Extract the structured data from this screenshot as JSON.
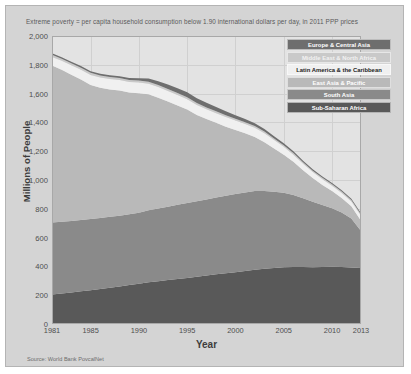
{
  "title": "Extreme poverty = per capita household consumption below 1.90 international dollars per day, in 2011 PPP prices",
  "source": "Source: World Bank PovcalNet",
  "axes": {
    "xlabel": "Year",
    "ylabel": "Millions of People"
  },
  "colors": {
    "figure_background": "#d4d4d4",
    "plot_background": "#e3e3e3",
    "grid": "#d0d0d0",
    "frame": "#a8a8a8",
    "text": "#4e4e4e"
  },
  "chart_data": {
    "type": "area",
    "title": "Extreme poverty = per capita household consumption below 1.90 international dollars per day, in 2011 PPP prices",
    "xlabel": "Year",
    "ylabel": "Millions of People",
    "grid": true,
    "legend_position": "top-right",
    "stacked": true,
    "xlim": [
      1981,
      2013
    ],
    "ylim": [
      0,
      2000
    ],
    "yticks": [
      "0",
      "200",
      "400",
      "600",
      "800",
      "1,000",
      "1,200",
      "1,400",
      "1,600",
      "1,800",
      "2,000"
    ],
    "ytick_values": [
      0,
      200,
      400,
      600,
      800,
      1000,
      1200,
      1400,
      1600,
      1800,
      2000
    ],
    "xticks": [
      "1981",
      "1985",
      "1990",
      "1995",
      "2000",
      "2005",
      "2010",
      "2013"
    ],
    "xtick_values": [
      1981,
      1985,
      1990,
      1995,
      2000,
      2005,
      2010,
      2013
    ],
    "x": [
      1981,
      1982,
      1983,
      1984,
      1985,
      1986,
      1987,
      1988,
      1989,
      1990,
      1991,
      1992,
      1993,
      1994,
      1995,
      1996,
      1997,
      1998,
      1999,
      2000,
      2001,
      2002,
      2003,
      2004,
      2005,
      2006,
      2007,
      2008,
      2009,
      2010,
      2011,
      2012,
      2013
    ],
    "series": [
      {
        "name": "Sub-Saharan Africa",
        "color": "#595959",
        "legend_text_color": "#ffffff",
        "values": [
          205,
          212,
          219,
          227,
          235,
          243,
          252,
          261,
          271,
          280,
          290,
          297,
          305,
          313,
          320,
          328,
          336,
          345,
          352,
          360,
          368,
          376,
          383,
          389,
          394,
          396,
          395,
          394,
          396,
          398,
          395,
          392,
          389
        ]
      },
      {
        "name": "South Asia",
        "color": "#8a8a8a",
        "legend_text_color": "#ffffff",
        "values": [
          500,
          498,
          497,
          496,
          495,
          493,
          492,
          491,
          492,
          493,
          500,
          505,
          510,
          515,
          520,
          524,
          528,
          533,
          538,
          542,
          546,
          548,
          540,
          530,
          517,
          500,
          478,
          455,
          430,
          405,
          380,
          340,
          256
        ]
      },
      {
        "name": "East Asia & Pacific",
        "color": "#b9b9b9",
        "legend_text_color": "#ffffff",
        "values": [
          1090,
          1055,
          1015,
          975,
          930,
          905,
          885,
          870,
          845,
          830,
          805,
          770,
          730,
          690,
          650,
          600,
          560,
          520,
          480,
          445,
          410,
          375,
          340,
          300,
          265,
          230,
          195,
          165,
          140,
          120,
          100,
          85,
          72
        ]
      },
      {
        "name": "Latin America & the Caribbean",
        "color": "#f0f0f0",
        "legend_text_color": "#1c1c1c",
        "values": [
          60,
          63,
          66,
          68,
          70,
          71,
          72,
          73,
          73,
          74,
          74,
          74,
          73,
          72,
          70,
          69,
          67,
          66,
          67,
          66,
          65,
          64,
          62,
          59,
          55,
          50,
          45,
          41,
          39,
          37,
          35,
          34,
          34
        ]
      },
      {
        "name": "Middle East & North Africa",
        "color": "#c9c9c9",
        "legend_text_color": "#f2f2f2",
        "values": [
          14,
          14,
          14,
          14,
          14,
          14,
          14,
          14,
          14,
          14,
          14,
          14,
          14,
          14,
          14,
          13,
          13,
          13,
          13,
          12,
          12,
          12,
          12,
          11,
          11,
          11,
          10,
          10,
          10,
          10,
          10,
          10,
          10
        ]
      },
      {
        "name": "Europe & Central Asia",
        "color": "#6e6e6e",
        "legend_text_color": "#ffffff",
        "values": [
          11,
          11,
          11,
          11,
          11,
          11,
          12,
          12,
          13,
          16,
          21,
          26,
          31,
          34,
          36,
          34,
          32,
          30,
          28,
          25,
          22,
          19,
          17,
          15,
          13,
          12,
          11,
          10,
          10,
          9,
          9,
          8,
          8
        ]
      }
    ],
    "legend_order": [
      "Europe & Central Asia",
      "Middle East & North Africa",
      "Latin America & the Caribbean",
      "East Asia & Pacific",
      "South Asia",
      "Sub-Saharan Africa"
    ]
  }
}
